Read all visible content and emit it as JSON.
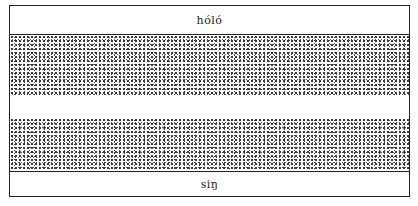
{
  "diagram": {
    "top_label": "hóló",
    "bottom_label": "siŋ",
    "bands": [
      {
        "type": "label",
        "text_key": "top_label"
      },
      {
        "type": "stippled"
      },
      {
        "type": "blank"
      },
      {
        "type": "stippled"
      },
      {
        "type": "label",
        "text_key": "bottom_label"
      }
    ]
  }
}
